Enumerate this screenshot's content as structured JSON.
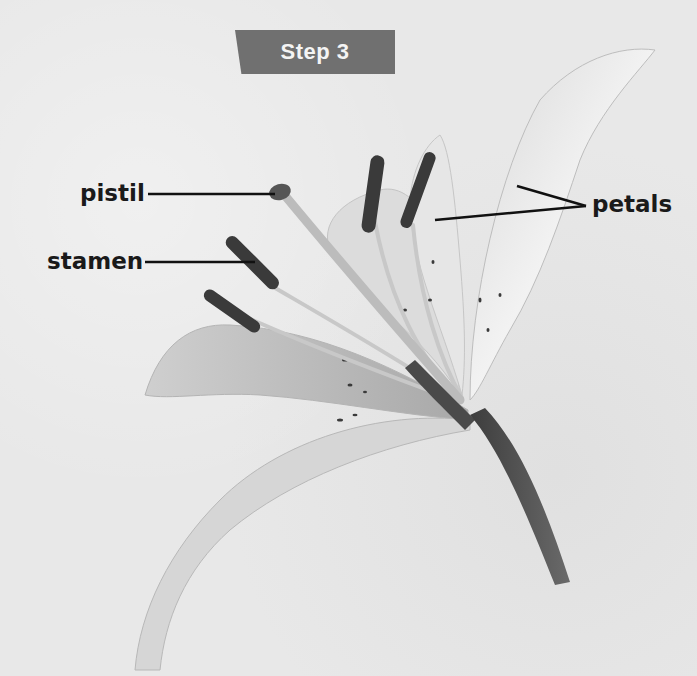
{
  "banner": {
    "title": "Step 3",
    "color": "#707070"
  },
  "labels": {
    "pistil": "pistil",
    "stamen": "stamen",
    "petals": "petals"
  },
  "figure": {
    "parts": [
      "pistil",
      "stamen",
      "petals",
      "stem"
    ],
    "background": "#e8e8e8",
    "line_color": "#111111"
  }
}
